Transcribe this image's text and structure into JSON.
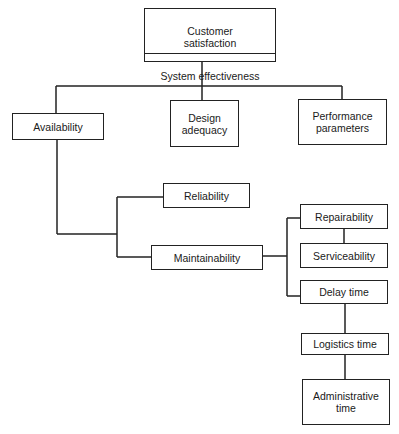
{
  "diagram": {
    "type": "hierarchy-tree",
    "root": {
      "top_label": "Customer\nsatisfaction",
      "bottom_label": "System effectiveness"
    },
    "level1": [
      {
        "id": "availability",
        "label": "Availability"
      },
      {
        "id": "design_adequacy",
        "label": "Design\nadequacy"
      },
      {
        "id": "performance_parameters",
        "label": "Performance\nparameters"
      }
    ],
    "availability_children": [
      {
        "id": "reliability",
        "label": "Reliability"
      },
      {
        "id": "maintainability",
        "label": "Maintainability"
      }
    ],
    "maintainability_children": [
      {
        "id": "repairability",
        "label": "Repairability"
      },
      {
        "id": "serviceability",
        "label": "Serviceability"
      },
      {
        "id": "delay_time",
        "label": "Delay time"
      }
    ],
    "delay_time_children": [
      {
        "id": "logistics_time",
        "label": "Logistics time"
      },
      {
        "id": "administrative_time",
        "label": "Administrative\ntime"
      }
    ],
    "edges": [
      [
        "System effectiveness",
        "Availability"
      ],
      [
        "System effectiveness",
        "Design adequacy"
      ],
      [
        "System effectiveness",
        "Performance parameters"
      ],
      [
        "Availability",
        "Reliability"
      ],
      [
        "Availability",
        "Maintainability"
      ],
      [
        "Maintainability",
        "Repairability"
      ],
      [
        "Maintainability",
        "Serviceability"
      ],
      [
        "Maintainability",
        "Delay time"
      ],
      [
        "Repairability",
        "Serviceability"
      ],
      [
        "Delay time",
        "Logistics time"
      ],
      [
        "Logistics time",
        "Administrative time"
      ]
    ],
    "line_color": "#222222",
    "box_fill": "#ffffff"
  }
}
